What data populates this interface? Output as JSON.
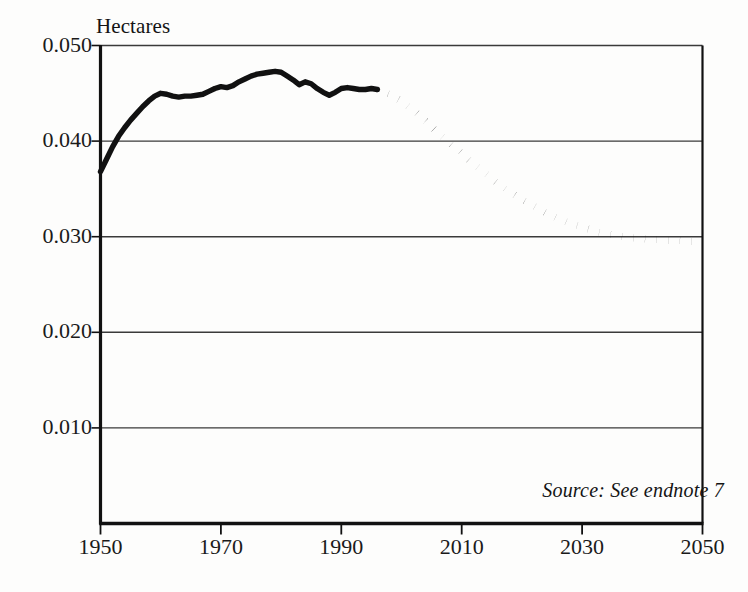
{
  "chart_data": {
    "type": "line",
    "title": "",
    "subtitle": "",
    "xlabel": "",
    "ylabel": "Hectares",
    "xlim": [
      1950,
      2050
    ],
    "ylim": [
      0.0,
      0.05
    ],
    "grid": "horizontal",
    "legend": "none",
    "yticks": [
      "0.010",
      "0.020",
      "0.030",
      "0.040",
      "0.050"
    ],
    "ytick_values": [
      0.01,
      0.02,
      0.03,
      0.04,
      0.05
    ],
    "xticks": [
      "1950",
      "1970",
      "1990",
      "2010",
      "2030",
      "2050"
    ],
    "xtick_values": [
      1950,
      1970,
      1990,
      2010,
      2030,
      2050
    ],
    "annotations": [
      {
        "name": "source-note",
        "text": "Source: See endnote 7",
        "style": "italic",
        "position": "bottom-right"
      }
    ],
    "series": [
      {
        "name": "Grain area per person (historical)",
        "style": "solid",
        "color": "#111111",
        "x": [
          1950,
          1951,
          1952,
          1953,
          1954,
          1955,
          1956,
          1957,
          1958,
          1959,
          1960,
          1961,
          1962,
          1963,
          1964,
          1965,
          1966,
          1967,
          1968,
          1969,
          1970,
          1971,
          1972,
          1973,
          1974,
          1975,
          1976,
          1977,
          1978,
          1979,
          1980,
          1981,
          1982,
          1983,
          1984,
          1985,
          1986,
          1987,
          1988,
          1989,
          1990,
          1991,
          1992,
          1993,
          1994,
          1995,
          1996
        ],
        "values": [
          0.0368,
          0.0381,
          0.0394,
          0.0405,
          0.0414,
          0.0422,
          0.0429,
          0.0436,
          0.0442,
          0.0447,
          0.045,
          0.0449,
          0.0447,
          0.0446,
          0.0447,
          0.0447,
          0.0448,
          0.0449,
          0.0452,
          0.0455,
          0.0457,
          0.0456,
          0.0458,
          0.0462,
          0.0465,
          0.0468,
          0.047,
          0.0471,
          0.0472,
          0.0473,
          0.0472,
          0.0468,
          0.0464,
          0.0459,
          0.0462,
          0.046,
          0.0455,
          0.0451,
          0.0448,
          0.0451,
          0.0455,
          0.0456,
          0.0455,
          0.0454,
          0.0454,
          0.0455,
          0.0454
        ]
      },
      {
        "name": "Grain area per person (projected)",
        "style": "dotted",
        "color": "#111111",
        "x": [
          1996,
          1998,
          2000,
          2002,
          2004,
          2006,
          2008,
          2010,
          2012,
          2014,
          2016,
          2018,
          2020,
          2022,
          2024,
          2026,
          2028,
          2030,
          2032,
          2034,
          2036,
          2038,
          2040,
          2042,
          2044,
          2046,
          2048,
          2050
        ],
        "values": [
          0.0454,
          0.0449,
          0.0442,
          0.0432,
          0.0421,
          0.0409,
          0.0398,
          0.0387,
          0.0376,
          0.0366,
          0.0356,
          0.0347,
          0.0339,
          0.0332,
          0.0325,
          0.0319,
          0.0314,
          0.031,
          0.0306,
          0.0303,
          0.0301,
          0.0299,
          0.0298,
          0.0297,
          0.0296,
          0.0296,
          0.0295,
          0.0295
        ]
      }
    ]
  },
  "colors": {
    "line": "#111111",
    "axis": "#111111",
    "grid": "#3a3a3a",
    "background": "#fdfdfc",
    "text": "#141414"
  },
  "axis_title": {
    "y": "Hectares"
  },
  "source": {
    "text": "Source: See endnote 7"
  }
}
